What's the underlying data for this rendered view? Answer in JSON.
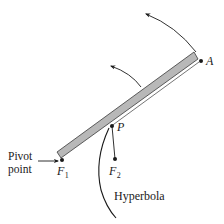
{
  "diagram": {
    "title": "",
    "colors": {
      "rod_fill": "#b8b8b8",
      "rod_stroke": "#3a3a3a",
      "ink": "#1a1a1a",
      "background": "#ffffff"
    },
    "labels": {
      "pivot_line1": "Pivot",
      "pivot_line2": "point",
      "point_A": "A",
      "point_P": "P",
      "focus1_letter": "F",
      "focus1_sub": "1",
      "focus2_letter": "F",
      "focus2_sub": "2",
      "curve": "Hyperbola"
    },
    "points": [
      {
        "id": "F1",
        "x": 62,
        "y": 160
      },
      {
        "id": "F2",
        "x": 115,
        "y": 159
      },
      {
        "id": "P",
        "x": 112,
        "y": 126
      },
      {
        "id": "A",
        "x": 201,
        "y": 61
      }
    ],
    "arrows": [
      {
        "id": "rotation-arrow-outer",
        "direction": "counterclockwise"
      },
      {
        "id": "rotation-arrow-inner",
        "direction": "counterclockwise"
      },
      {
        "id": "pivot-pointer-arrow",
        "direction": "right"
      }
    ]
  }
}
